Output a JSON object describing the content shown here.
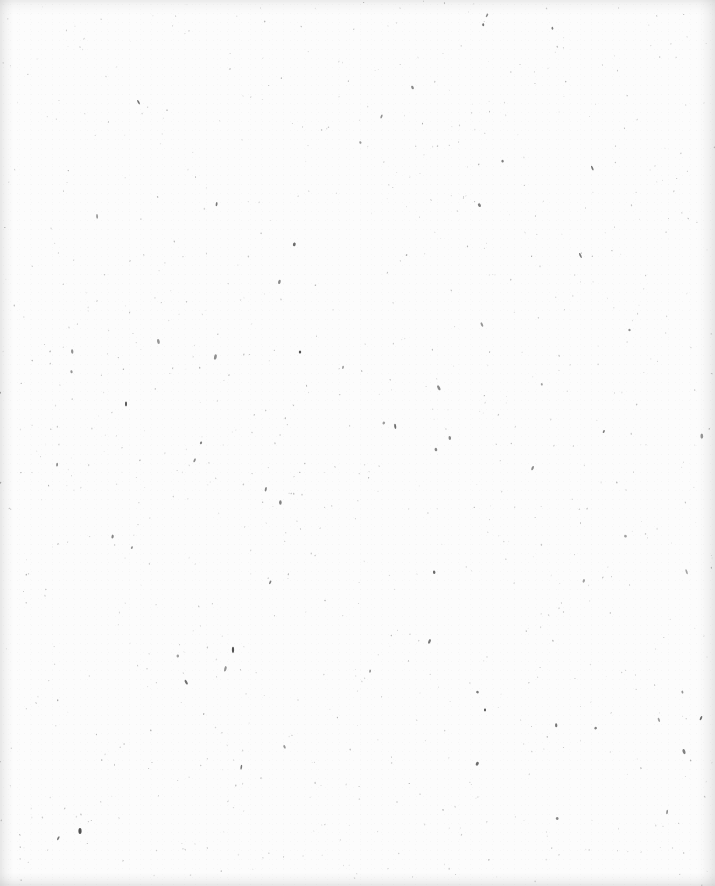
{
  "document": {
    "type": "blank scanned page",
    "text_blocks": [],
    "paper_color": "#fcfcfc",
    "speckle_color": "#5a5a5a",
    "edge_shadow_color": "#e6e6e6"
  }
}
